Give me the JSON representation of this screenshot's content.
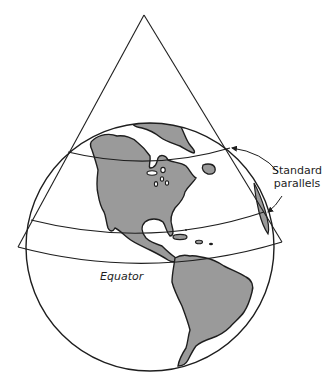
{
  "diagram": {
    "type": "conic projection illustration",
    "labels": {
      "standard_parallels_line1": "Standard",
      "standard_parallels_line2": "parallels",
      "equator": "Equator"
    },
    "elements": [
      {
        "name": "cone",
        "shape": "triangle outline intersecting globe"
      },
      {
        "name": "globe",
        "shape": "circle showing western hemisphere"
      },
      {
        "name": "upper-standard-parallel",
        "shape": "curved line"
      },
      {
        "name": "lower-standard-parallel",
        "shape": "curved line"
      },
      {
        "name": "cone-base-rim",
        "shape": "curved line"
      },
      {
        "name": "north-america",
        "shape": "land mass"
      },
      {
        "name": "south-america",
        "shape": "land mass"
      },
      {
        "name": "great-lakes",
        "shape": "small lakes"
      },
      {
        "name": "caribbean-islands",
        "shape": "small islands"
      },
      {
        "name": "leader-arrows",
        "shape": "two arrows from label to parallels"
      }
    ],
    "colors": {
      "land": "#9a9a9a",
      "stroke": "#1e1e1e",
      "background": "#ffffff"
    }
  }
}
